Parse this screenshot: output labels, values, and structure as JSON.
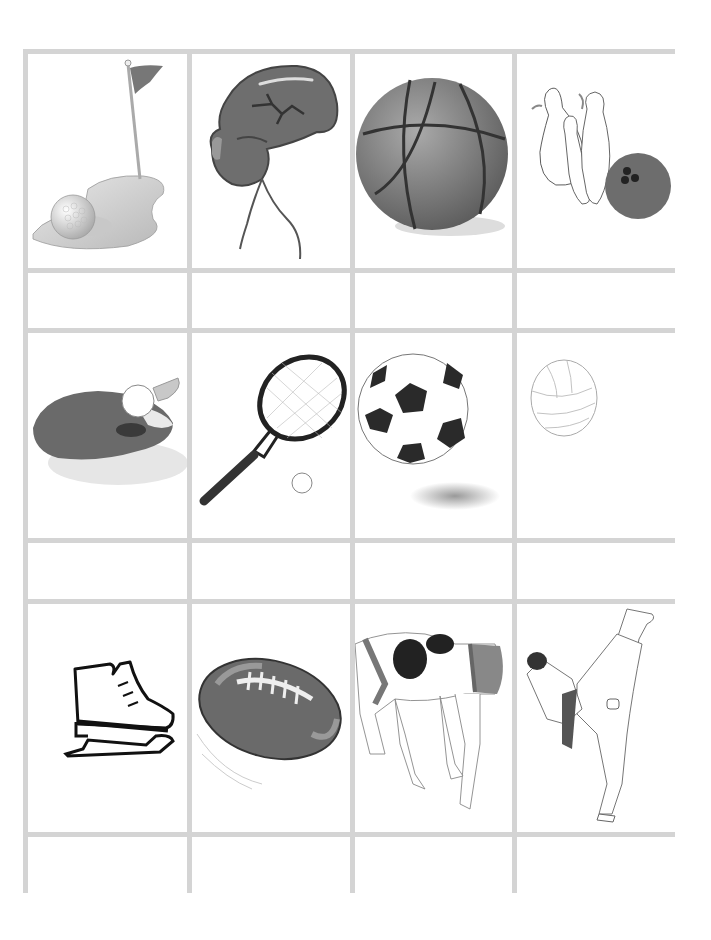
{
  "worksheet": {
    "layout": {
      "columns": 4,
      "rows": 6,
      "grid_color": "#d4d4d4"
    },
    "rows": [
      {
        "type": "images",
        "items": [
          {
            "sport": "golf",
            "icon": "golf-icon"
          },
          {
            "sport": "boxing",
            "icon": "boxing-glove-icon"
          },
          {
            "sport": "basketball",
            "icon": "basketball-icon"
          },
          {
            "sport": "bowling",
            "icon": "bowling-icon"
          }
        ]
      },
      {
        "type": "labels",
        "items": [
          "",
          "",
          "",
          ""
        ]
      },
      {
        "type": "images",
        "items": [
          {
            "sport": "table tennis",
            "icon": "ping-pong-paddle-icon"
          },
          {
            "sport": "tennis",
            "icon": "tennis-racket-icon"
          },
          {
            "sport": "soccer",
            "icon": "soccer-ball-icon"
          },
          {
            "sport": "volleyball",
            "icon": "volleyball-icon"
          }
        ]
      },
      {
        "type": "labels",
        "items": [
          "",
          "",
          "",
          ""
        ]
      },
      {
        "type": "images",
        "items": [
          {
            "sport": "ice skating",
            "icon": "ice-skate-icon"
          },
          {
            "sport": "american football",
            "icon": "football-icon"
          },
          {
            "sport": "wrestling",
            "icon": "wrestling-icon"
          },
          {
            "sport": "karate",
            "icon": "karate-icon"
          }
        ]
      },
      {
        "type": "labels",
        "items": [
          "",
          "",
          "",
          ""
        ]
      }
    ]
  }
}
